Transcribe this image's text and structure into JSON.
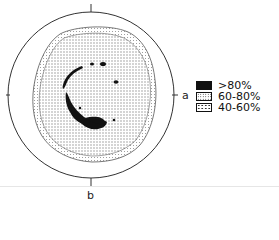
{
  "figure": {
    "type": "pole-figure",
    "axes": {
      "right": "a",
      "bottom": "b"
    },
    "legend": [
      {
        "label": ">80%",
        "pattern": "solid-black"
      },
      {
        "label": "60-80%",
        "pattern": "dense-dots"
      },
      {
        "label": "40-60%",
        "pattern": "sparse-dots"
      }
    ],
    "colors": {
      "ink": "#111111",
      "background": "#ffffff"
    }
  }
}
